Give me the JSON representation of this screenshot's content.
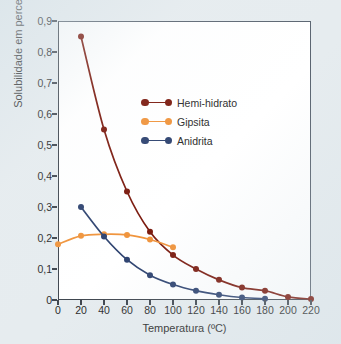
{
  "figure": {
    "background_color": "#e6ecef",
    "plot_background_color": "#ffffff",
    "axis_color": "#3f464f"
  },
  "axes": {
    "x_title": "Temperatura (ºC)",
    "y_title": "Solubilidade em percentual",
    "x_ticks": [
      "0",
      "20",
      "40",
      "60",
      "80",
      "100",
      "120",
      "140",
      "160",
      "180",
      "200",
      "220"
    ],
    "y_ticks": [
      "0,9",
      "0,8",
      "0,7",
      "0,6",
      "0,5",
      "0,4",
      "0,3",
      "0,2",
      "0,1",
      "0"
    ]
  },
  "legend": {
    "items": [
      {
        "label": "Hemi-hidrato",
        "color": "#7B1A0E"
      },
      {
        "label": "Gipsita",
        "color": "#F0943C"
      },
      {
        "label": "Anidrita",
        "color": "#2E4370"
      }
    ]
  },
  "chart_data": {
    "type": "line",
    "title": "",
    "xlabel": "Temperatura (ºC)",
    "ylabel": "Solubilidade em percentual",
    "xlim": [
      0,
      220
    ],
    "ylim": [
      0,
      0.9
    ],
    "x_tick_values": [
      0,
      20,
      40,
      60,
      80,
      100,
      120,
      140,
      160,
      180,
      200,
      220
    ],
    "y_tick_values": [
      0,
      0.1,
      0.2,
      0.3,
      0.4,
      0.5,
      0.6,
      0.7,
      0.8,
      0.9
    ],
    "grid": false,
    "legend_position": "upper center",
    "series": [
      {
        "name": "Hemi-hidrato",
        "color": "#7B1A0E",
        "x": [
          20,
          40,
          60,
          80,
          100,
          120,
          140,
          160,
          180,
          200,
          220
        ],
        "values": [
          0.85,
          0.55,
          0.35,
          0.22,
          0.145,
          0.1,
          0.065,
          0.04,
          0.03,
          0.01,
          0.003
        ]
      },
      {
        "name": "Gipsita",
        "color": "#F0943C",
        "x": [
          0,
          20,
          40,
          60,
          80,
          100
        ],
        "values": [
          0.18,
          0.207,
          0.212,
          0.21,
          0.195,
          0.17
        ]
      },
      {
        "name": "Anidrita",
        "color": "#2E4370",
        "x": [
          20,
          40,
          60,
          80,
          100,
          120,
          140,
          160,
          180
        ],
        "values": [
          0.3,
          0.205,
          0.13,
          0.08,
          0.05,
          0.03,
          0.017,
          0.008,
          0.004
        ]
      }
    ]
  }
}
